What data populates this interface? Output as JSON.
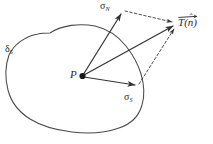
{
  "figure": {
    "background_color": "#ffffff",
    "line_color": "#3a3a3a",
    "text_color": "#2a2a2a",
    "width": 213,
    "height": 144
  },
  "labels": {
    "normal_stress": {
      "symbol": "σ",
      "subscript": "N",
      "full": "σN"
    },
    "shear_stress": {
      "symbol": "σ",
      "subscript": "S",
      "full": "σS"
    },
    "surface_element": {
      "symbol": "δ",
      "subscript": "S",
      "full": "δS"
    },
    "point": {
      "symbol": "P"
    },
    "traction": {
      "symbol": "T",
      "open_paren": "(",
      "argument": "n",
      "hat": "ˆ",
      "close_paren": ")",
      "full": "T(n̂)"
    }
  },
  "geometry": {
    "point_p": {
      "x": 82,
      "y": 76
    },
    "sigma_n_tip": {
      "x": 122,
      "y": 12
    },
    "sigma_s_tip": {
      "x": 137,
      "y": 85
    },
    "traction_tip": {
      "x": 176,
      "y": 25
    },
    "arrow_style": "solid",
    "construction_style": "dashed"
  }
}
